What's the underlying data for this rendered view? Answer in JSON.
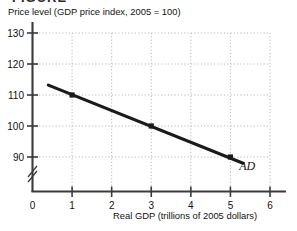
{
  "page": {
    "clipped_heading": "FIGURE"
  },
  "chart_data": {
    "type": "line",
    "title": "",
    "xlabel": "Real GDP (trillions of 2005 dollars)",
    "ylabel": "Price level (GDP price index, 2005 = 100)",
    "xlim": [
      0,
      6.4
    ],
    "ylim": [
      84,
      133
    ],
    "xticks": [
      0,
      1,
      2,
      3,
      4,
      5,
      6
    ],
    "xticklabels": [
      "0",
      "1",
      "2",
      "3",
      "4",
      "5",
      "6"
    ],
    "yticks": [
      90,
      100,
      110,
      120,
      130
    ],
    "yticklabels": [
      "90",
      "100",
      "110",
      "120",
      "130"
    ],
    "grid": "dotted-both",
    "axis_break": "y-axis below 90",
    "legend": "none",
    "series": [
      {
        "name": "AD",
        "annotation": "AD",
        "line_start": {
          "x": 0.4,
          "y": 113.2
        },
        "line_end": {
          "x": 5.32,
          "y": 88.0
        },
        "marker": "filled-square",
        "x": [
          1,
          3,
          5
        ],
        "values": [
          110,
          100,
          90
        ],
        "points": [
          {
            "x": 1,
            "y": 110
          },
          {
            "x": 3,
            "y": 100
          },
          {
            "x": 5,
            "y": 90
          }
        ]
      }
    ]
  },
  "colors": {
    "curve": "#1a1a1a",
    "axis": "#3a3a3a",
    "grid": "#b9b9b9",
    "text": "#111111"
  }
}
